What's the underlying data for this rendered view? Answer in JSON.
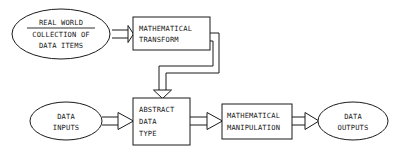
{
  "diagram": {
    "background_color": "#ffffff",
    "line_color": "#1a1a1a",
    "nodes": {
      "real_world": {
        "shape": "ellipse",
        "line1": "REAL WORLD",
        "line2": "COLLECTION OF",
        "line3": "DATA ITEMS",
        "underlined_line": "REAL WORLD"
      },
      "mathematical_transform": {
        "shape": "rectangle",
        "line1": "MATHEMATICAL",
        "line2": "TRANSFORM"
      },
      "data_inputs": {
        "shape": "ellipse",
        "line1": "DATA",
        "line2": "INPUTS"
      },
      "abstract_data_type": {
        "shape": "rectangle",
        "line1": "ABSTRACT",
        "line2": "DATA",
        "line3": "TYPE"
      },
      "mathematical_manipulation": {
        "shape": "rectangle",
        "line1": "MATHEMATICAL",
        "line2": "MANIPULATION"
      },
      "data_outputs": {
        "shape": "ellipse",
        "line1": "DATA",
        "line2": "OUTPUTS"
      }
    },
    "connectors": [
      {
        "id": "real-world-to-transform",
        "from": "real_world",
        "to": "mathematical_transform",
        "style": "hollow-block-arrow",
        "direction": "right"
      },
      {
        "id": "transform-to-abstract-data-type",
        "from": "mathematical_transform",
        "to": "abstract_data_type",
        "style": "hollow-block-arrow",
        "direction": "down",
        "routing": "right-down-left-down"
      },
      {
        "id": "data-inputs-to-abstract-data-type",
        "from": "data_inputs",
        "to": "abstract_data_type",
        "style": "hollow-block-arrow",
        "direction": "right"
      },
      {
        "id": "abstract-data-type-to-manipulation",
        "from": "abstract_data_type",
        "to": "mathematical_manipulation",
        "style": "hollow-block-arrow",
        "direction": "right"
      },
      {
        "id": "manipulation-to-data-outputs",
        "from": "mathematical_manipulation",
        "to": "data_outputs",
        "style": "hollow-block-arrow",
        "direction": "right"
      }
    ]
  }
}
